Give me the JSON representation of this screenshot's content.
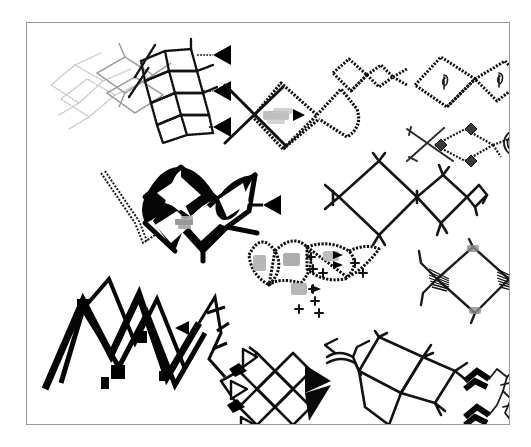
{
  "document": {
    "kind": "scanned-figure-plate",
    "page_background": "#ffffff",
    "frame": {
      "border_color": "#9a9a9a",
      "x": 26,
      "y": 22,
      "width": 484,
      "height": 403
    },
    "ink_colors": {
      "black": "#000000",
      "dark": "#111111",
      "mid_gray": "#777777",
      "light_gray": "#b8b8b8",
      "faint_gray": "#cfcfcf",
      "blob_gray": "#a9a9a9"
    },
    "caption": "",
    "title": ""
  },
  "figures": [
    {
      "id": "fig-1",
      "name": "faint-lattice-with-arrow-stack",
      "position": {
        "x": 18,
        "y": 14,
        "width": 190,
        "height": 116
      },
      "description": "Faint gray overlapping diamond lattice at left fading into a denser stippled chain at right, terminating in a vertical stack of three solid triangular arrowheads.",
      "marks": {
        "arrowheads": 3,
        "arrow_style": "solid-triangle-left",
        "text_blobs": 0,
        "plus_signs": 0
      },
      "ink": "mixed-faint-to-black"
    },
    {
      "id": "fig-2",
      "name": "crossed-diamond-loop-with-label-blob",
      "position": {
        "x": 196,
        "y": 52,
        "width": 142,
        "height": 92
      },
      "description": "Large stippled diamond crossed by an X-shaped pair of strokes, joined to an open loop on the right; a small blurred gray label blob with a tiny arrowhead sits inside the diamond.",
      "marks": {
        "arrowheads": 1,
        "arrow_style": "solid-triangle-right",
        "text_blobs": 1,
        "plus_signs": 0
      },
      "ink": "black-stipple"
    },
    {
      "id": "fig-3",
      "name": "small-double-ring-pair",
      "position": {
        "x": 302,
        "y": 32,
        "width": 84,
        "height": 46
      },
      "description": "A small stippled square ring linked to a smaller diamond ring, ending in a short forked tail.",
      "marks": {
        "arrowheads": 0,
        "arrow_style": "",
        "text_blobs": 0,
        "plus_signs": 0
      },
      "ink": "black-stipple"
    },
    {
      "id": "fig-4",
      "name": "twin-diamond-chain-with-glyphs",
      "position": {
        "x": 386,
        "y": 30,
        "width": 118,
        "height": 60
      },
      "description": "Two large stippled diamonds meeting at a shared vertex, each enclosing a small hooked glyph; short stub at the right end.",
      "marks": {
        "arrowheads": 0,
        "arrow_style": "",
        "text_blobs": 2,
        "plus_signs": 0
      },
      "ink": "black-stipple"
    },
    {
      "id": "fig-5",
      "name": "crossed-chain-with-nested-circle",
      "position": {
        "x": 378,
        "y": 98,
        "width": 126,
        "height": 52
      },
      "description": "A long diagonal stroke crossing a diamond-link chain with small solid node diamonds, ending in a nested concentric ring at the right.",
      "marks": {
        "arrowheads": 0,
        "arrow_style": "",
        "text_blobs": 0,
        "plus_signs": 0
      },
      "ink": "black-stipple"
    },
    {
      "id": "fig-6",
      "name": "heavy-bold-diamond-cluster",
      "position": {
        "x": 72,
        "y": 136,
        "width": 184,
        "height": 104
      },
      "description": "Bold heavy-ink cluster of four interlocking diamonds with a thin trailing zigzag tail at the lower left, a small gray text blob at the centre and a solid triangular arrowhead at the right edge.",
      "marks": {
        "arrowheads": 1,
        "arrow_style": "solid-triangle-left",
        "text_blobs": 1,
        "plus_signs": 0
      },
      "ink": "heavy-black"
    },
    {
      "id": "fig-7",
      "name": "open-double-diamond-with-side-ring",
      "position": {
        "x": 296,
        "y": 128,
        "width": 164,
        "height": 96
      },
      "description": "Two large open outlined diamonds sharing a vertex with short branch stubs, a small square ring appended on the right and a bracket-like fork on the left.",
      "marks": {
        "arrowheads": 0,
        "arrow_style": "",
        "text_blobs": 0,
        "plus_signs": 0
      },
      "ink": "thin-black-outline"
    },
    {
      "id": "fig-8",
      "name": "lens-chain-with-plus-signs",
      "position": {
        "x": 218,
        "y": 206,
        "width": 150,
        "height": 94
      },
      "description": "Chain of three stippled lens/diamond shapes, each containing a blurred gray label blob, surrounded by a scatter of small plus signs and a few tiny arrowheads.",
      "marks": {
        "arrowheads": 3,
        "arrow_style": "solid-triangle-right",
        "text_blobs": 4,
        "plus_signs": 9
      },
      "ink": "black-stipple"
    },
    {
      "id": "fig-9",
      "name": "hatched-node-diamond",
      "position": {
        "x": 384,
        "y": 212,
        "width": 122,
        "height": 94
      },
      "description": "A single large open diamond whose left and right vertices are filled with dense hatched wedges; four short bonds radiate outward from the sides.",
      "marks": {
        "arrowheads": 0,
        "arrow_style": "",
        "text_blobs": 0,
        "plus_signs": 0
      },
      "ink": "outline-with-hatched-nodes"
    },
    {
      "id": "fig-10",
      "name": "bold-zigzag-mountain-range",
      "position": {
        "x": 12,
        "y": 250,
        "width": 198,
        "height": 128
      },
      "description": "Large heavy zigzag 'mountain range' of thick stepped strokes with several solid square nodes, a lone small triangular arrowhead floating to the right of the peak, and a tall thin zigzag at the far right.",
      "marks": {
        "arrowheads": 1,
        "arrow_style": "solid-triangle-left",
        "text_blobs": 0,
        "plus_signs": 0
      },
      "ink": "heavy-black"
    },
    {
      "id": "fig-11",
      "name": "diamond-grid-with-triangle-markers",
      "position": {
        "x": 186,
        "y": 322,
        "width": 124,
        "height": 96
      },
      "description": "Grid of four outlined diamonds bordered on the left by three hollow triangular arrowheads and two solid black rhombi, and on the right by two large solid filled triangles.",
      "marks": {
        "arrowheads": 5,
        "arrow_style": "mixed-hollow-and-solid-triangle",
        "text_blobs": 0,
        "plus_signs": 0
      },
      "ink": "black-outline-with-solids"
    },
    {
      "id": "fig-12",
      "name": "double-bond-fan-with-skew-squares",
      "position": {
        "x": 296,
        "y": 308,
        "width": 150,
        "height": 104
      },
      "description": "A fan of parallel double-line bonds on the left opening into a pair of skewed overlapping squares with short terminal forks.",
      "marks": {
        "arrowheads": 0,
        "arrow_style": "",
        "text_blobs": 0,
        "plus_signs": 0
      },
      "ink": "thin-black-outline"
    },
    {
      "id": "fig-13",
      "name": "bold-double-hook-with-thin-chain",
      "position": {
        "x": 436,
        "y": 338,
        "width": 70,
        "height": 78
      },
      "description": "Two short bold hooked strokes on the left paired with a light thin zigzag chain bearing small tick branches on the right.",
      "marks": {
        "arrowheads": 0,
        "arrow_style": "",
        "text_blobs": 0,
        "plus_signs": 0
      },
      "ink": "mixed-bold-and-thin"
    }
  ]
}
